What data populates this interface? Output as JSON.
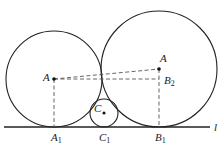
{
  "diagram": {
    "line_label": "l",
    "points": {
      "A": {
        "label": "A",
        "sub": ""
      },
      "B": {
        "label": "A",
        "sub": ""
      },
      "C": {
        "label": "C",
        "sub": ""
      },
      "A1": {
        "label": "A",
        "sub": "1"
      },
      "B1": {
        "label": "B",
        "sub": "1"
      },
      "B2": {
        "label": "B",
        "sub": "2"
      },
      "C1": {
        "label": "C",
        "sub": "1"
      }
    },
    "colors": {
      "stroke": "#222222",
      "dashed": "#555555"
    }
  }
}
